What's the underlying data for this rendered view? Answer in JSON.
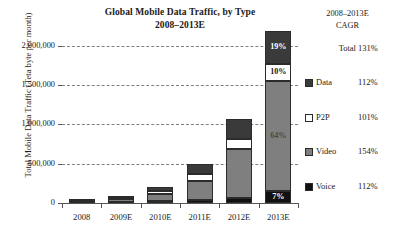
{
  "chart_data": {
    "type": "bar",
    "stacked": true,
    "title": "Global Mobile Data Traffic, by Type",
    "subtitle": "2008–2013E",
    "xlabel": "",
    "ylabel": "Total Mobile Data Traffic (Teta byte per month)",
    "categories": [
      "2008",
      "2009E",
      "2010E",
      "2011E",
      "2012E",
      "2013E"
    ],
    "ylim": [
      0,
      2200000
    ],
    "yticks": [
      0,
      500000,
      1000000,
      1500000,
      2000000
    ],
    "ytick_labels": [
      "0",
      "500,000",
      "1,000,000",
      "1,500,000",
      "2,000,000"
    ],
    "grid": "horizontal-dashed",
    "legend_position": "right",
    "series": [
      {
        "name": "Voice",
        "color": "#111111",
        "values": [
          6000,
          14000,
          22000,
          38000,
          62000,
          152000
        ]
      },
      {
        "name": "Video",
        "color": "#7f7f7f",
        "values": [
          12000,
          42000,
          95000,
          240000,
          620000,
          1400000
        ]
      },
      {
        "name": "P2P",
        "color": "#ffffff",
        "values": [
          4000,
          14000,
          36000,
          90000,
          135000,
          218000
        ]
      },
      {
        "name": "Data",
        "color": "#3a3a3a",
        "values": [
          6000,
          20000,
          47000,
          132000,
          248000,
          415000
        ]
      }
    ],
    "data_labels": {
      "2013E": {
        "Data": "19%",
        "P2P": "10%",
        "Video": "64%",
        "Voice": "7%"
      }
    },
    "annotations": []
  },
  "legend": {
    "header_line1": "2008–2013E",
    "header_line2": "CAGR",
    "rows": [
      {
        "name": "Total",
        "value": "131%",
        "swatch": "none",
        "color": ""
      },
      {
        "name": "Data",
        "value": "112%",
        "swatch": "solid",
        "color": "#3a3a3a"
      },
      {
        "name": "P2P",
        "value": "101%",
        "swatch": "solid",
        "color": "#ffffff"
      },
      {
        "name": "Video",
        "value": "154%",
        "swatch": "solid",
        "color": "#7f7f7f"
      },
      {
        "name": "Voice",
        "value": "112%",
        "swatch": "solid",
        "color": "#111111"
      }
    ]
  },
  "colors": {
    "data": "#3a3a3a",
    "p2p": "#ffffff",
    "video": "#7f7f7f",
    "voice": "#111111",
    "gridline": "#808080",
    "axis": "#555555",
    "text": "#1a1a1a",
    "background": "#ffffff"
  }
}
